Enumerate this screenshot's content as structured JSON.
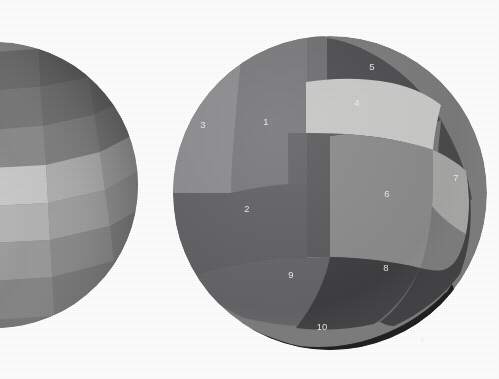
{
  "figure": {
    "background_color": "#ffffff",
    "width": 499,
    "height": 379
  },
  "left_sphere": {
    "name": "partially-visible-gridded-sphere",
    "center_x": -5,
    "center_y": 185,
    "radius": 143,
    "description": "Sphere clipped by the left edge of the frame, surface subdivided into a latitude/longitude checkerboard of quadrilateral cells whose brightness varies smoothly from dark at the upper-right limb to light near the lower-left center.",
    "grid": {
      "latitude_bands": 7,
      "longitude_bands": 7,
      "cell_shape": "quadrilateral"
    },
    "shade_range": [
      "#5a5a5a",
      "#e0e0e0"
    ]
  },
  "right_sphere": {
    "name": "numbered-region-sphere",
    "center_x": 330,
    "center_y": 193,
    "radius": 157,
    "description": "Sphere subdivided into ten labelled surface regions of differing gray value.",
    "regions": [
      {
        "id": "1",
        "label": "1",
        "color": "#78787a",
        "label_x": 266,
        "label_y": 122
      },
      {
        "id": "2",
        "label": "2",
        "color": "#606062",
        "label_x": 247,
        "label_y": 209
      },
      {
        "id": "3",
        "label": "3",
        "color": "#8b8b8d",
        "label_x": 203,
        "label_y": 125
      },
      {
        "id": "4",
        "label": "4",
        "color": "#c9c9c7",
        "label_x": 357,
        "label_y": 103
      },
      {
        "id": "5",
        "label": "5",
        "color": "#4c4c4e",
        "label_x": 372,
        "label_y": 67
      },
      {
        "id": "6",
        "label": "6",
        "color": "#8a8a8a",
        "label_x": 387,
        "label_y": 194
      },
      {
        "id": "7",
        "label": "7",
        "color": "#a6a6a4",
        "label_x": 456,
        "label_y": 178
      },
      {
        "id": "8",
        "label": "8",
        "color": "#3b3b3d",
        "label_x": 386,
        "label_y": 268
      },
      {
        "id": "9",
        "label": "9",
        "color": "#646466",
        "label_x": 291,
        "label_y": 275
      },
      {
        "id": "10",
        "label": "10",
        "color": "#151517",
        "label_x": 322,
        "label_y": 327
      }
    ],
    "label_color": "#f2f2f2"
  }
}
